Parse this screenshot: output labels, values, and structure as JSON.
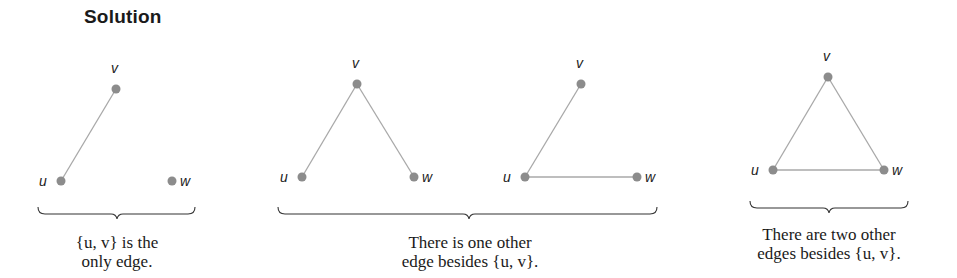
{
  "title": "Solution",
  "colors": {
    "node": "#8c8c8c",
    "edge": "#a8a8a8",
    "brace": "#333333",
    "text": "#1a1a1a"
  },
  "graphs": [
    {
      "id": "graph-1",
      "nodes": [
        {
          "label": "v",
          "x": 116,
          "y": 89
        },
        {
          "label": "u",
          "x": 61,
          "y": 181
        },
        {
          "label": "w",
          "x": 172,
          "y": 181
        }
      ],
      "edges": [
        [
          "u",
          "v"
        ]
      ]
    },
    {
      "id": "graph-2",
      "nodes": [
        {
          "label": "v",
          "x": 357,
          "y": 84
        },
        {
          "label": "u",
          "x": 302,
          "y": 177
        },
        {
          "label": "w",
          "x": 414,
          "y": 177
        }
      ],
      "edges": [
        [
          "u",
          "v"
        ],
        [
          "v",
          "w"
        ]
      ]
    },
    {
      "id": "graph-3",
      "nodes": [
        {
          "label": "v",
          "x": 581,
          "y": 84
        },
        {
          "label": "u",
          "x": 525,
          "y": 177
        },
        {
          "label": "w",
          "x": 637,
          "y": 177
        }
      ],
      "edges": [
        [
          "u",
          "v"
        ],
        [
          "u",
          "w"
        ]
      ]
    },
    {
      "id": "graph-4",
      "nodes": [
        {
          "label": "v",
          "x": 828,
          "y": 77
        },
        {
          "label": "u",
          "x": 773,
          "y": 170
        },
        {
          "label": "w",
          "x": 884,
          "y": 170
        }
      ],
      "edges": [
        [
          "u",
          "v"
        ],
        [
          "v",
          "w"
        ],
        [
          "u",
          "w"
        ]
      ]
    }
  ],
  "captions": [
    {
      "lines": [
        "{u, v} is the",
        "only edge."
      ]
    },
    {
      "lines": [
        "There is one other",
        "edge besides {u, v}."
      ]
    },
    {
      "lines": [
        "There are two other",
        "edges besides {u, v}."
      ]
    }
  ]
}
